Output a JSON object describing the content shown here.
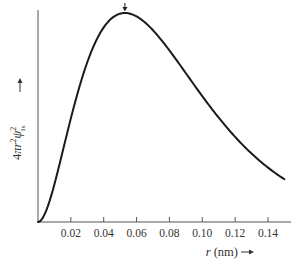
{
  "chart_data": {
    "type": "line",
    "title": "",
    "xlabel": "r (nm)",
    "xlabel_arrow": "→",
    "ylabel": "4πr²ψ₁ₛ²",
    "ylabel_arrow": "→",
    "xlim": [
      0,
      0.153
    ],
    "ylim": [
      0,
      1.07
    ],
    "x_ticks": [
      0.02,
      0.04,
      0.06,
      0.08,
      0.1,
      0.12,
      0.14
    ],
    "x_tick_labels": [
      "0.02",
      "0.04",
      "0.06",
      "0.08",
      "0.10",
      "0.12",
      "0.14"
    ],
    "y_ticks": [],
    "grid": false,
    "legend": null,
    "annotations": [
      {
        "type": "arrow",
        "x": 0.0529,
        "label": "",
        "description": "arrow marking maximum at Bohr radius"
      }
    ],
    "series": [
      {
        "name": "radial probability density 1s",
        "x": [
          0,
          0.005,
          0.01,
          0.015,
          0.02,
          0.025,
          0.03,
          0.035,
          0.04,
          0.045,
          0.05,
          0.0529,
          0.055,
          0.06,
          0.065,
          0.07,
          0.075,
          0.08,
          0.085,
          0.09,
          0.095,
          0.1,
          0.105,
          0.11,
          0.115,
          0.12,
          0.125,
          0.13,
          0.135,
          0.14,
          0.145,
          0.15
        ],
        "y": [
          0,
          0.066,
          0.215,
          0.392,
          0.564,
          0.711,
          0.827,
          0.91,
          0.962,
          0.991,
          0.999,
          1.0,
          0.998,
          0.981,
          0.951,
          0.91,
          0.862,
          0.809,
          0.753,
          0.695,
          0.637,
          0.58,
          0.525,
          0.473,
          0.423,
          0.377,
          0.334,
          0.295,
          0.259,
          0.227,
          0.198,
          0.172
        ]
      }
    ]
  }
}
